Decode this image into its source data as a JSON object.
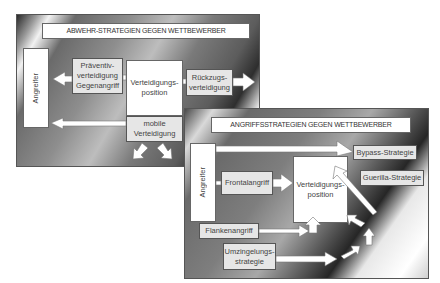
{
  "defense_panel": {
    "title": "ABWEHR-STRATEGIEN GEGEN WETTBEWERBER",
    "attacker": "Angreifer",
    "position": [
      "Verteidigungs-",
      "position"
    ],
    "preventive": [
      "Präventiv-",
      "verteidigung",
      "Gegenangriff"
    ],
    "retreat": [
      "Rückzugs-",
      "verteidigung"
    ],
    "mobile": [
      "mobile",
      "Verteidigung"
    ]
  },
  "attack_panel": {
    "title": "ANGRIFFSSTRATEGIEN GEGEN WETTBEWERBER",
    "attacker": "Angreifer",
    "position": [
      "Verteidigungs-",
      "position"
    ],
    "frontal": "Frontalangriff",
    "bypass": "Bypass-Strategie",
    "guerilla": "Guerilla-Strategie",
    "flank": "Flankenangriff",
    "encircle": [
      "Umzingelungs-",
      "strategie"
    ]
  },
  "colors": {
    "box_white": "#ffffff",
    "box_grey": "#e6e6e6",
    "border": "#555555",
    "arrow_fill": "#ffffff"
  }
}
